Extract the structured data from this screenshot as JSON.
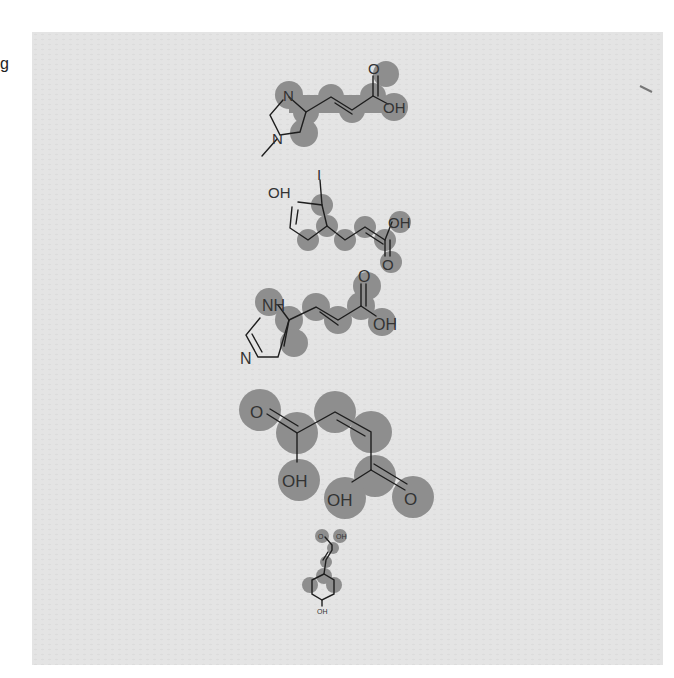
{
  "page": {
    "stray_char": "g",
    "background_color": "#e4e4e4",
    "highlight_color": "#8e8e8e",
    "bond_color": "#1e1e1e"
  },
  "molecules": [
    {
      "name": "1-methylurocanic acid",
      "labels": {
        "n_top": "N",
        "n_bottom": "N",
        "o": "O",
        "oh": "OH"
      }
    },
    {
      "name": "iodo-coumaric acid",
      "labels": {
        "oh_phenol": "OH",
        "i": "I",
        "oh": "OH",
        "o": "O"
      }
    },
    {
      "name": "urocanic acid",
      "labels": {
        "nh": "NH",
        "n": "N",
        "o": "O",
        "oh": "OH"
      }
    },
    {
      "name": "maleic acid",
      "labels": {
        "o1": "O",
        "oh1": "OH",
        "oh2": "OH",
        "o2": "O"
      }
    },
    {
      "name": "p-coumaric acid",
      "labels": {
        "o": "O",
        "oh_acid": "OH",
        "oh_phenol": "OH"
      }
    }
  ]
}
